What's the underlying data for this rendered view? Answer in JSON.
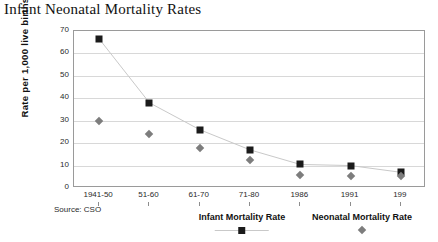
{
  "source_note": "Source: CSO",
  "chart_data": {
    "type": "line",
    "title": "Infant Neonatal Mortality Rates",
    "xlabel": "",
    "ylabel": "Rate per 1,000 live births",
    "categories": [
      "1941-50",
      "51-60",
      "61-70",
      "71-80",
      "1986",
      "1991",
      "199"
    ],
    "ylim": [
      0,
      70
    ],
    "yticks": [
      0,
      10,
      20,
      30,
      40,
      50,
      60,
      70
    ],
    "grid": true,
    "legend_position": "bottom",
    "series": [
      {
        "name": "Infant Mortality Rate",
        "marker": "square",
        "color": "#1b1b1b",
        "line_color": "#c9c9c9",
        "values": [
          66.5,
          38,
          26,
          17,
          10.5,
          10,
          7
        ]
      },
      {
        "name": "Neonatal Mortality Rate",
        "marker": "diamond",
        "color": "#7d7d7d",
        "line_color": "none",
        "values": [
          30,
          24,
          18,
          12.5,
          6,
          5.5,
          5.5
        ]
      }
    ]
  }
}
